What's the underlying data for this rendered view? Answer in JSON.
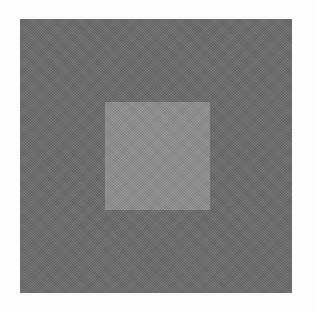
{
  "figure": {
    "background_color": "#ffffff",
    "surround": {
      "color": "#6b6b6b",
      "x": 20,
      "y": 19,
      "width": 272,
      "height": 274
    },
    "target": {
      "color": "#8d8d8d",
      "x": 105,
      "y": 102,
      "width": 105,
      "height": 108
    }
  }
}
